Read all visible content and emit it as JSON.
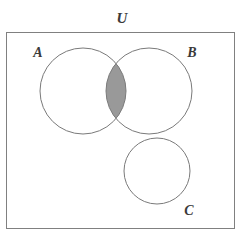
{
  "diagram": {
    "type": "venn-diagram",
    "title_label": "U",
    "canvas": {
      "width": 248,
      "height": 242
    },
    "background_color": "#ffffff",
    "universe": {
      "name": "universal-set",
      "label": "U",
      "label_x": 122,
      "label_y": 23,
      "rect": {
        "x": 6,
        "y": 32,
        "width": 228,
        "height": 196
      },
      "stroke_color": "#808080",
      "stroke_width": 1,
      "fill_color": "#ffffff"
    },
    "sets": [
      {
        "id": "A",
        "label": "A",
        "cx": 83,
        "cy": 91,
        "r": 43,
        "label_x": 38,
        "label_y": 57,
        "stroke_color": "#7a7a7a",
        "fill_color": "#ffffff"
      },
      {
        "id": "B",
        "label": "B",
        "cx": 149,
        "cy": 91,
        "r": 43,
        "label_x": 192,
        "label_y": 57,
        "stroke_color": "#7a7a7a",
        "fill_color": "#ffffff"
      },
      {
        "id": "C",
        "label": "C",
        "cx": 157,
        "cy": 171,
        "r": 33,
        "label_x": 189,
        "label_y": 215,
        "stroke_color": "#7a7a7a",
        "fill_color": "#ffffff"
      }
    ],
    "shaded_regions": [
      {
        "id": "A-intersect-B",
        "description": "intersection of A and B",
        "fill_color": "#999999",
        "stroke_color": "#7a7a7a"
      }
    ]
  }
}
